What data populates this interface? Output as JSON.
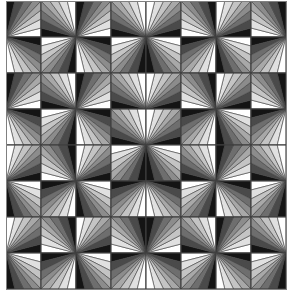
{
  "pattern": {
    "rows": 8,
    "cols": 8,
    "cell_width": 35,
    "cell_height": 36,
    "slices": 8,
    "stroke_color": "#404040",
    "border_color": "#808080",
    "shades": [
      "#ffffff",
      "#e0e0e0",
      "#c4c4c4",
      "#a8a8a8",
      "#8c8c8c",
      "#6e6e6e",
      "#4a4a4a",
      "#141414"
    ],
    "cells": [
      [
        [
          "bl",
          0
        ],
        [
          "br",
          1
        ],
        [
          "bl",
          0
        ],
        [
          "br",
          1
        ],
        [
          "bl",
          1
        ],
        [
          "br",
          0
        ],
        [
          "bl",
          1
        ],
        [
          "br",
          0
        ]
      ],
      [
        [
          "tl",
          1
        ],
        [
          "tr",
          0
        ],
        [
          "tl",
          1
        ],
        [
          "tr",
          0
        ],
        [
          "tl",
          0
        ],
        [
          "tr",
          1
        ],
        [
          "tl",
          0
        ],
        [
          "tr",
          1
        ]
      ],
      [
        [
          "bl",
          0
        ],
        [
          "br",
          1
        ],
        [
          "bl",
          0
        ],
        [
          "br",
          1
        ],
        [
          "bl",
          1
        ],
        [
          "br",
          0
        ],
        [
          "bl",
          1
        ],
        [
          "br",
          0
        ]
      ],
      [
        [
          "tl",
          1
        ],
        [
          "tr",
          0
        ],
        [
          "tl",
          1
        ],
        [
          "br",
          1
        ],
        [
          "bl",
          1
        ],
        [
          "tr",
          1
        ],
        [
          "tl",
          0
        ],
        [
          "tr",
          1
        ]
      ],
      [
        [
          "bl",
          1
        ],
        [
          "br",
          0
        ],
        [
          "bl",
          1
        ],
        [
          "tr",
          0
        ],
        [
          "tl",
          0
        ],
        [
          "br",
          1
        ],
        [
          "bl",
          0
        ],
        [
          "br",
          1
        ]
      ],
      [
        [
          "tl",
          0
        ],
        [
          "tr",
          1
        ],
        [
          "tl",
          0
        ],
        [
          "tr",
          1
        ],
        [
          "tl",
          1
        ],
        [
          "tr",
          0
        ],
        [
          "tl",
          1
        ],
        [
          "tr",
          0
        ]
      ],
      [
        [
          "bl",
          1
        ],
        [
          "br",
          0
        ],
        [
          "bl",
          1
        ],
        [
          "br",
          0
        ],
        [
          "bl",
          0
        ],
        [
          "br",
          1
        ],
        [
          "bl",
          0
        ],
        [
          "br",
          1
        ]
      ],
      [
        [
          "tl",
          0
        ],
        [
          "tr",
          1
        ],
        [
          "tl",
          0
        ],
        [
          "tr",
          1
        ],
        [
          "tl",
          1
        ],
        [
          "tr",
          0
        ],
        [
          "tl",
          1
        ],
        [
          "tr",
          0
        ]
      ]
    ]
  }
}
